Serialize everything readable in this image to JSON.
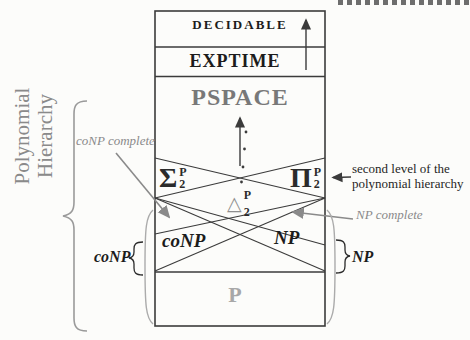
{
  "figure": {
    "levels": {
      "decidable": "DECIDABLE",
      "exptime": "EXPTIME",
      "pspace": "PSPACE",
      "p": "P"
    },
    "classes": {
      "sigma2p": {
        "base": "Σ",
        "sup": "P",
        "sub": "2"
      },
      "pi2p": {
        "base": "Π",
        "sup": "P",
        "sub": "2"
      },
      "delta2p": {
        "base": "△",
        "sup": "P",
        "sub": "2"
      },
      "conp": "coNP",
      "np": "NP"
    },
    "side_labels": {
      "conp": "coNP",
      "np": "NP"
    },
    "rotated_label": {
      "line1": "Polynomial",
      "line2": "Hierarchy"
    },
    "annotations": {
      "conp_complete": "coNP complete",
      "np_complete": "NP complete",
      "second_level": {
        "line1": "second level of the",
        "line2": "polynomial hierarchy"
      }
    },
    "colors": {
      "ink": "#3b3b3b",
      "gray": "#8a8a8a",
      "pspace_gray": "#787878",
      "p_gray": "#a8a8a8"
    }
  }
}
